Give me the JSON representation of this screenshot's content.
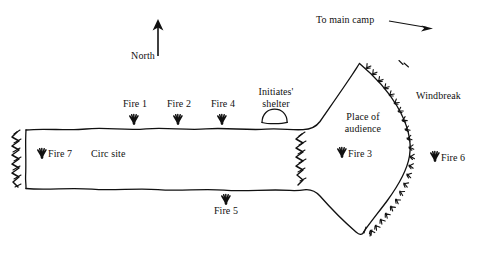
{
  "diagram": {
    "compass": {
      "label": "North",
      "icon": "north-arrow-icon",
      "direction": "up"
    },
    "direction_note": {
      "label": "To main camp",
      "icon": "right-arrow-icon",
      "direction": "right"
    },
    "areas": [
      {
        "id": "circ-site",
        "label": "Circ site"
      },
      {
        "id": "place-of-audience",
        "label": "Place of\naudience",
        "line1": "Place of",
        "line2": "audience"
      },
      {
        "id": "initiates-shelter",
        "label": "Initiates'\nshelter",
        "line1": "Initiates'",
        "line2": "shelter",
        "icon": "dome-hut-icon"
      }
    ],
    "windbreaks": [
      {
        "id": "windbreak-right",
        "label": "Windbreak"
      },
      {
        "id": "windbreak-left",
        "label": ""
      },
      {
        "id": "windbreak-middle",
        "label": ""
      },
      {
        "id": "windbreak-lower-right",
        "label": ""
      }
    ],
    "fires": [
      {
        "id": "fire-1",
        "label": "Fire 1",
        "icon": "fire-marker-icon"
      },
      {
        "id": "fire-2",
        "label": "Fire 2",
        "icon": "fire-marker-icon"
      },
      {
        "id": "fire-3",
        "label": "Fire 3",
        "icon": "fire-marker-icon"
      },
      {
        "id": "fire-4",
        "label": "Fire 4",
        "icon": "fire-marker-icon"
      },
      {
        "id": "fire-5",
        "label": "Fire 5",
        "icon": "fire-marker-icon"
      },
      {
        "id": "fire-6",
        "label": "Fire 6",
        "icon": "fire-marker-icon"
      },
      {
        "id": "fire-7",
        "label": "Fire 7",
        "icon": "fire-marker-icon"
      }
    ],
    "colors": {
      "ink": "#111111",
      "background": "#ffffff"
    }
  }
}
